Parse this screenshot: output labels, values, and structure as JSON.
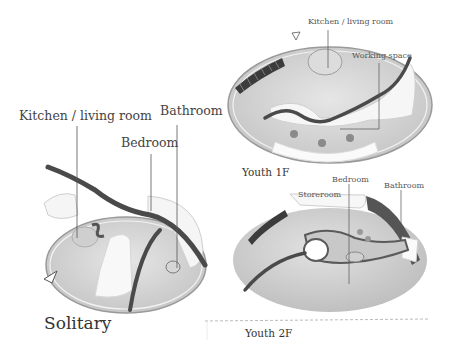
{
  "solitary": {
    "title": "Solitary",
    "labels": {
      "kitchen": "Kitchen / living room",
      "bedroom": "Bedroom",
      "bathroom": "Bathroom"
    }
  },
  "youth_1f": {
    "title": "Youth 1F",
    "labels": {
      "kitchen": "Kitchen / living room",
      "working": "Working space"
    }
  },
  "youth_2f": {
    "title": "Youth 2F",
    "labels": {
      "storeroom": "Storeroom",
      "bedroom": "Bedroom",
      "bathroom": "Bathroom"
    }
  },
  "colors": {
    "floor": "#d8d8d8",
    "wall_white": "#f4f4f4",
    "dark_band": "#4a4a4a",
    "line": "#555555"
  }
}
